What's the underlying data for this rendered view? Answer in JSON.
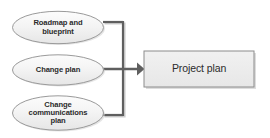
{
  "diagram": {
    "type": "flow-convergence",
    "background_color": "#ffffff",
    "palette": {
      "ellipse_fill_top": "#fbfbfb",
      "ellipse_fill_bottom": "#e9e9e9",
      "ellipse_stroke": "#9a9a9a",
      "box_fill": "#ececec",
      "box_stroke": "#8c8c8c",
      "connector": "#5f5f5f",
      "shadow": "#c6c6c6",
      "text": "#2b2b2b"
    },
    "inputs": [
      {
        "id": "roadmap-and-blueprint",
        "label": "Roadmap and\nblueprint",
        "shape": "ellipse"
      },
      {
        "id": "change-plan",
        "label": "Change plan",
        "shape": "ellipse"
      },
      {
        "id": "change-communications-plan",
        "label": "Change\ncommunications\nplan",
        "shape": "ellipse"
      }
    ],
    "output": {
      "id": "project-plan",
      "label": "Project plan",
      "shape": "rectangle"
    },
    "connector": {
      "style": "orthogonal-merge",
      "arrowhead": "filled-triangle",
      "direction": "left-to-right"
    }
  }
}
